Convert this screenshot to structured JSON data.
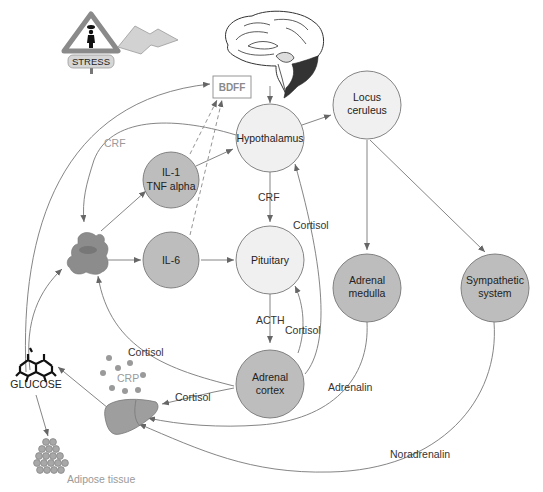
{
  "diagram": {
    "colors": {
      "light_node_fill": "#f0f0f0",
      "dark_node_fill": "#bdbdbd",
      "edge": "#777777",
      "macrophage": "#8c8c8c",
      "liver": "#9e9e9e",
      "crp_dots": "#9a9a9a",
      "adipose": "#a8a8a8"
    },
    "icons": {
      "stress_sign": {
        "label": "STRESS"
      },
      "lightning": "lightning-bolt-icon",
      "brain": "brain-icon",
      "glucose": "glucose-molecule-icon",
      "macrophage": "immune-cell-icon",
      "liver": "liver-icon",
      "adipose": "adipose-cells-icon"
    },
    "nodes": {
      "bdff": {
        "label": "BDFF"
      },
      "hypothalamus": {
        "label": "Hypothalamus"
      },
      "locus_ceruleus": {
        "line1": "Locus",
        "line2": "ceruleus"
      },
      "il1_tnf": {
        "line1": "IL-1",
        "line2": "TNF alpha"
      },
      "il6": {
        "label": "IL-6"
      },
      "pituitary": {
        "label": "Pituitary"
      },
      "adrenal_medulla": {
        "line1": "Adrenal",
        "line2": "medulla"
      },
      "sympathetic_system": {
        "line1": "Sympathetic",
        "line2": "system"
      },
      "adrenal_cortex": {
        "line1": "Adrenal",
        "line2": "cortex"
      },
      "glucose": {
        "label": "GLUCOSE"
      },
      "crp": {
        "label": "CRP"
      },
      "adipose_tissue": {
        "label": "Adipose tissue"
      }
    },
    "edge_labels": {
      "crf_loop": "CRF",
      "crf_hypo_pit": "CRF",
      "cortisol_to_hypo": "Cortisol",
      "acth": "ACTH",
      "cortisol_to_pit": "Cortisol",
      "cortisol_to_macrophage": "Cortisol",
      "cortisol_to_liver": "Cortisol",
      "adrenalin": "Adrenalin",
      "noradrenalin": "Noradrenalin"
    }
  }
}
